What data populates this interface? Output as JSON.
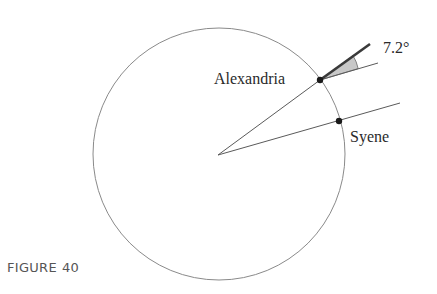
{
  "figure": {
    "caption_label": "FIGURE",
    "caption_number": "40"
  },
  "labels": {
    "alexandria": "Alexandria",
    "syene": "Syene",
    "angle": "7.2°"
  },
  "geometry": {
    "circle": {
      "cx": 219,
      "cy": 154,
      "r": 126
    },
    "center": {
      "x": 218,
      "y": 155
    },
    "alexandria_point": {
      "x": 320,
      "y": 80
    },
    "syene_point": {
      "x": 339,
      "y": 121
    },
    "alexandria_shadow_line_end": {
      "x": 370,
      "y": 44
    },
    "alexandria_sun_ray_end": {
      "x": 378,
      "y": 63
    },
    "syene_sun_ray_end": {
      "x": 400,
      "y": 103
    }
  },
  "colors": {
    "circle_stroke": "#8a8a8a",
    "line_stroke": "#5a5a5a",
    "thick_line": "#3a3a3a",
    "point_fill": "#1a1a1a",
    "wedge_fill": "#c8c8c8",
    "text": "#2a2a2a",
    "caption": "#555555"
  }
}
